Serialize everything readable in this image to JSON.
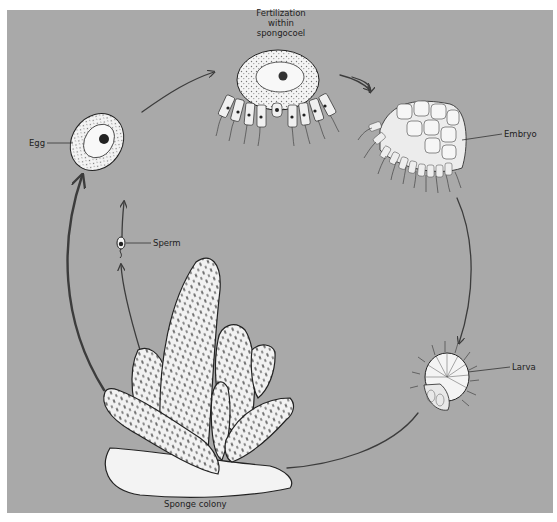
{
  "diagram": {
    "background_color": "#a9a9a9",
    "line_color": "#3c3c3c",
    "labels": {
      "fertilization": [
        "Fertilization",
        "within",
        "spongocoel"
      ],
      "egg": "Egg",
      "embryo": "Embryo",
      "sperm": "Sperm",
      "larva": "Larva",
      "sponge_colony": "Sponge colony"
    },
    "stages": [
      {
        "id": "sponge-colony",
        "label": "Sponge colony"
      },
      {
        "id": "sperm",
        "label": "Sperm"
      },
      {
        "id": "egg",
        "label": "Egg"
      },
      {
        "id": "fertilization",
        "label": "Fertilization within spongocoel"
      },
      {
        "id": "embryo",
        "label": "Embryo"
      },
      {
        "id": "larva",
        "label": "Larva"
      }
    ],
    "flow": [
      {
        "from": "sponge-colony",
        "to": "egg"
      },
      {
        "from": "sponge-colony",
        "to": "sperm"
      },
      {
        "from": "egg",
        "to": "fertilization"
      },
      {
        "from": "fertilization",
        "to": "embryo"
      },
      {
        "from": "embryo",
        "to": "larva"
      },
      {
        "from": "larva",
        "to": "sponge-colony"
      }
    ]
  }
}
